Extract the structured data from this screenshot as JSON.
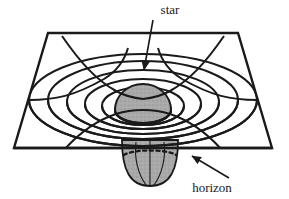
{
  "figure": {
    "type": "schematic-diagram",
    "background_color": "#ffffff",
    "line_color": "#1a1a1a",
    "shade_color": "#a8a8a8",
    "labels": [
      {
        "id": "star",
        "text": "star",
        "x": 170,
        "y": 14,
        "anchor": "middle",
        "pointer": "arrow-down"
      },
      {
        "id": "horizon",
        "text": "horizon",
        "x": 212,
        "y": 190,
        "anchor": "middle",
        "pointer": "arrow-up-left"
      }
    ],
    "sheet": {
      "name": "embedding-plane",
      "corners": [
        [
          48,
          33
        ],
        [
          238,
          33
        ],
        [
          272,
          148
        ],
        [
          14,
          148
        ]
      ]
    },
    "funnel": {
      "name": "gravity-well",
      "ring_count": 6,
      "meridian_count": 6
    },
    "star_body": {
      "name": "star-dome",
      "fill": "#a8a8a8"
    },
    "horizon_line": {
      "name": "event-horizon",
      "style": "dashed"
    }
  }
}
